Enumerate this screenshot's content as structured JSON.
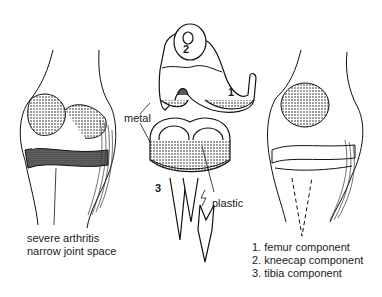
{
  "diagram": {
    "panels": [
      {
        "id": "arthritic-knee",
        "caption_lines": [
          "severe arthritis",
          "narrow joint space"
        ]
      },
      {
        "id": "prosthesis-components"
      },
      {
        "id": "replaced-knee"
      }
    ],
    "labels": {
      "metal": "metal",
      "plastic": "plastic",
      "num1": "1",
      "num2": "2",
      "num3": "3"
    },
    "legend": [
      "1. femur component",
      "2. kneecap component",
      "3. tibia component"
    ]
  }
}
